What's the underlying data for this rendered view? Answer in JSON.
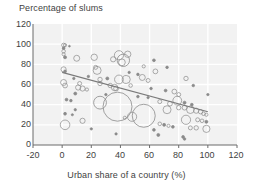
{
  "chart_data": {
    "type": "scatter",
    "title": "",
    "ylabel": "Percentage of slums",
    "xlabel": "Urban share of a country (%)",
    "xlim": [
      -20,
      120
    ],
    "ylim": [
      0,
      120
    ],
    "xticks": [
      -20,
      0,
      20,
      40,
      60,
      80,
      100,
      120
    ],
    "yticks": [
      0,
      20,
      40,
      60,
      80,
      100,
      120
    ],
    "grid": true,
    "legend": "none",
    "marker_style": "open-circle-bubble",
    "bubble_size_encodes": "population",
    "colors": {
      "plot_background": "#f2f2f2",
      "gridline": "#ffffff",
      "marker_stroke": "#8a8a8a",
      "trendline": "#7a7a7a",
      "text": "#3f3f3f"
    },
    "trendline": {
      "type": "linear",
      "x_start": 0,
      "y_start": 72,
      "x_end": 100,
      "y_end": 33
    },
    "points": [
      {
        "x": 1,
        "y": 99,
        "r": 2.0
      },
      {
        "x": 2,
        "y": 99,
        "r": 1.6
      },
      {
        "x": 1,
        "y": 96,
        "r": 1.4
      },
      {
        "x": 5,
        "y": 98,
        "r": 0.9
      },
      {
        "x": 1,
        "y": 93,
        "r": 1.8
      },
      {
        "x": 1,
        "y": 90,
        "r": 1.6
      },
      {
        "x": 2,
        "y": 87,
        "r": 1.5
      },
      {
        "x": 10,
        "y": 86,
        "r": 3.0
      },
      {
        "x": 22,
        "y": 87,
        "r": 3.2
      },
      {
        "x": 39,
        "y": 89,
        "r": 4.6
      },
      {
        "x": 45,
        "y": 90,
        "r": 3.2
      },
      {
        "x": 35,
        "y": 85,
        "r": 2.6
      },
      {
        "x": 42,
        "y": 84,
        "r": 6.2
      },
      {
        "x": 41,
        "y": 82,
        "r": 3.4
      },
      {
        "x": 63,
        "y": 84,
        "r": 1.4
      },
      {
        "x": 1,
        "y": 75,
        "r": 2.6
      },
      {
        "x": 2,
        "y": 73,
        "r": 1.4
      },
      {
        "x": 24,
        "y": 74,
        "r": 4.0
      },
      {
        "x": 23,
        "y": 77,
        "r": 2.0
      },
      {
        "x": 56,
        "y": 78,
        "r": 1.6
      },
      {
        "x": 72,
        "y": 77,
        "r": 1.3
      },
      {
        "x": 64,
        "y": 73,
        "r": 2.4
      },
      {
        "x": 26,
        "y": 65,
        "r": 2.2
      },
      {
        "x": 31,
        "y": 66,
        "r": 1.5
      },
      {
        "x": 39,
        "y": 65,
        "r": 4.4
      },
      {
        "x": 44,
        "y": 65,
        "r": 4.0
      },
      {
        "x": 55,
        "y": 67,
        "r": 3.0
      },
      {
        "x": 59,
        "y": 64,
        "r": 2.0
      },
      {
        "x": 85,
        "y": 66,
        "r": 2.2
      },
      {
        "x": 1,
        "y": 62,
        "r": 3.0
      },
      {
        "x": 2,
        "y": 59,
        "r": 2.4
      },
      {
        "x": 12,
        "y": 61,
        "r": 2.0
      },
      {
        "x": 26,
        "y": 61,
        "r": 2.2
      },
      {
        "x": 33,
        "y": 59,
        "r": 2.2
      },
      {
        "x": 36,
        "y": 57,
        "r": 3.2
      },
      {
        "x": 37,
        "y": 56,
        "r": 2.4
      },
      {
        "x": 47,
        "y": 59,
        "r": 1.8
      },
      {
        "x": 11,
        "y": 57,
        "r": 2.6
      },
      {
        "x": 14,
        "y": 56,
        "r": 2.6
      },
      {
        "x": 17,
        "y": 55,
        "r": 1.6
      },
      {
        "x": 61,
        "y": 56,
        "r": 1.3
      },
      {
        "x": 71,
        "y": 54,
        "r": 1.4
      },
      {
        "x": 77,
        "y": 53,
        "r": 2.4
      },
      {
        "x": 80,
        "y": 50,
        "r": 2.0
      },
      {
        "x": 9,
        "y": 51,
        "r": 1.5
      },
      {
        "x": 3,
        "y": 45,
        "r": 1.4
      },
      {
        "x": 6,
        "y": 44,
        "r": 1.3
      },
      {
        "x": 26,
        "y": 42,
        "r": 6.4
      },
      {
        "x": 38,
        "y": 38,
        "r": 14.5
      },
      {
        "x": 56,
        "y": 29,
        "r": 11.5
      },
      {
        "x": 48,
        "y": 28,
        "r": 4.6
      },
      {
        "x": 43,
        "y": 27,
        "r": 1.6
      },
      {
        "x": 67,
        "y": 43,
        "r": 2.0
      },
      {
        "x": 74,
        "y": 41,
        "r": 2.4
      },
      {
        "x": 79,
        "y": 44,
        "r": 4.4
      },
      {
        "x": 84,
        "y": 42,
        "r": 1.5
      },
      {
        "x": 89,
        "y": 40,
        "r": 1.4
      },
      {
        "x": 72,
        "y": 35,
        "r": 4.0
      },
      {
        "x": 80,
        "y": 37,
        "r": 2.2
      },
      {
        "x": 84,
        "y": 37,
        "r": 2.4
      },
      {
        "x": 88,
        "y": 35,
        "r": 3.8
      },
      {
        "x": 92,
        "y": 34,
        "r": 2.6
      },
      {
        "x": 95,
        "y": 33,
        "r": 2.2
      },
      {
        "x": 97,
        "y": 31,
        "r": 1.8
      },
      {
        "x": 99,
        "y": 30,
        "r": 1.6
      },
      {
        "x": 2,
        "y": 31,
        "r": 1.4
      },
      {
        "x": 14,
        "y": 24,
        "r": 2.6
      },
      {
        "x": 2,
        "y": 20,
        "r": 4.8
      },
      {
        "x": 85,
        "y": 25,
        "r": 4.6
      },
      {
        "x": 93,
        "y": 25,
        "r": 2.0
      },
      {
        "x": 96,
        "y": 24,
        "r": 1.8
      },
      {
        "x": 99,
        "y": 23,
        "r": 1.5
      },
      {
        "x": 67,
        "y": 21,
        "r": 1.8
      },
      {
        "x": 70,
        "y": 20,
        "r": 1.5
      },
      {
        "x": 73,
        "y": 19,
        "r": 1.6
      },
      {
        "x": 76,
        "y": 18,
        "r": 1.4
      },
      {
        "x": 88,
        "y": 17,
        "r": 2.0
      },
      {
        "x": 92,
        "y": 17,
        "r": 2.2
      },
      {
        "x": 99,
        "y": 16,
        "r": 3.6
      },
      {
        "x": 63,
        "y": 15,
        "r": 1.4
      },
      {
        "x": 66,
        "y": 10,
        "r": 1.5
      },
      {
        "x": 83,
        "y": 8,
        "r": 1.4
      },
      {
        "x": 84,
        "y": 6,
        "r": 1.3
      },
      {
        "x": 37,
        "y": 11,
        "r": 1.2
      },
      {
        "x": 20,
        "y": 16,
        "r": 1.2
      },
      {
        "x": 9,
        "y": 35,
        "r": 1.2
      },
      {
        "x": 7,
        "y": 30,
        "r": 1.1
      },
      {
        "x": 52,
        "y": 48,
        "r": 1.3
      },
      {
        "x": 59,
        "y": 47,
        "r": 1.2
      },
      {
        "x": 30,
        "y": 50,
        "r": 1.2
      },
      {
        "x": 46,
        "y": 72,
        "r": 1.2
      },
      {
        "x": 52,
        "y": 70,
        "r": 1.3
      },
      {
        "x": 90,
        "y": 59,
        "r": 1.3
      },
      {
        "x": 100,
        "y": 50,
        "r": 1.2
      },
      {
        "x": 18,
        "y": 68,
        "r": 1.2
      },
      {
        "x": 8,
        "y": 66,
        "r": 1.2
      }
    ]
  }
}
